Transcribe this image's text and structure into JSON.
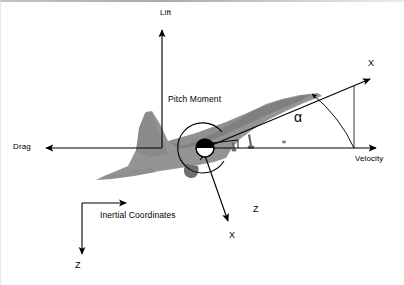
{
  "figure": {
    "domain": "aerodynamics-free-body-diagram",
    "background_color": "#ffffff",
    "ink_color": "#000000",
    "aircraft_fill_color": "#8c8c8c",
    "width": 404,
    "height": 285
  },
  "labels": {
    "lift": "Lift",
    "drag": "Drag",
    "velocity": "Velocity",
    "pitch_moment": "Pitch Moment",
    "alpha": "α",
    "body_x": "X",
    "body_z": "Z",
    "wind_x": "X",
    "inertial_caption": "Inertial Coordinates",
    "inertial_z": "Z"
  },
  "vectors": [
    {
      "name": "lift",
      "label": "Lift",
      "direction": "up",
      "from": [
        162,
        148
      ],
      "to": [
        162,
        28
      ],
      "label_pos": [
        160,
        12
      ]
    },
    {
      "name": "drag",
      "label": "Drag",
      "direction": "left",
      "from": [
        162,
        148
      ],
      "to": [
        44,
        148
      ],
      "label_pos": [
        14,
        144
      ]
    },
    {
      "name": "velocity",
      "label": "Velocity",
      "direction": "right",
      "from": [
        205,
        148
      ],
      "to": [
        378,
        148
      ],
      "label_pos": [
        356,
        156
      ]
    },
    {
      "name": "wind-x-axis",
      "label": "X",
      "direction": "up-right",
      "from": [
        205,
        148
      ],
      "to": [
        372,
        78
      ],
      "label_pos": [
        369,
        62
      ]
    },
    {
      "name": "body-x-axis",
      "label": "X",
      "direction": "down-right",
      "from": [
        205,
        148
      ],
      "to": [
        228,
        222
      ],
      "label_pos": [
        230,
        234
      ]
    },
    {
      "name": "body-z-axis",
      "label": "Z",
      "direction": "up-right",
      "from": [
        205,
        148
      ],
      "to": [
        212,
        160
      ],
      "label_pos": [
        254,
        208
      ]
    },
    {
      "name": "inertial-x-axis",
      "direction": "right",
      "from": [
        82,
        203
      ],
      "to": [
        128,
        203
      ]
    },
    {
      "name": "inertial-z-axis",
      "label": "Z",
      "direction": "down",
      "from": [
        82,
        203
      ],
      "to": [
        82,
        256
      ],
      "label_pos": [
        76,
        262
      ]
    }
  ],
  "angle": {
    "name": "angle-of-attack",
    "symbol": "α",
    "between": [
      "velocity",
      "wind-x-axis"
    ],
    "vertex": [
      205,
      148
    ],
    "label_pos": [
      297,
      118
    ]
  },
  "moment": {
    "name": "pitch-moment",
    "label": "Pitch Moment",
    "center": [
      205,
      148
    ],
    "radius": 25,
    "label_pos": [
      170,
      99
    ]
  },
  "markers": [
    {
      "name": "center-of-gravity",
      "symbol": "quartered-circle",
      "pos": [
        205,
        148
      ],
      "radius": 9
    }
  ]
}
